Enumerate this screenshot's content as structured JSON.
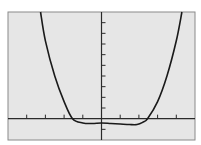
{
  "chart_data": {
    "type": "line",
    "title": "",
    "xlabel": "",
    "ylabel": "",
    "xlim": [
      -5,
      5
    ],
    "ylim": [
      -2,
      10
    ],
    "x_tick_step": 1,
    "y_tick_step": 1,
    "grid": false,
    "legend": null,
    "series": [
      {
        "name": "f(x)",
        "x": [
          -3.26,
          -3.0,
          -2.5,
          -2.0,
          -1.55,
          -1.0,
          -0.5,
          0.0,
          0.5,
          1.0,
          1.5,
          1.9,
          2.2,
          2.46,
          3.0,
          3.5,
          4.0,
          4.3
        ],
        "y": [
          10.0,
          7.3,
          4.0,
          1.6,
          0.0,
          -0.4,
          -0.45,
          -0.4,
          -0.45,
          -0.5,
          -0.55,
          -0.55,
          -0.35,
          0.0,
          1.6,
          4.0,
          7.3,
          10.0
        ]
      }
    ]
  },
  "screen": {
    "background": "#e6e6e6",
    "frame_color": "#8a8a8a",
    "axis_color": "#2a2a2a",
    "curve_color": "#1a1a1a"
  }
}
